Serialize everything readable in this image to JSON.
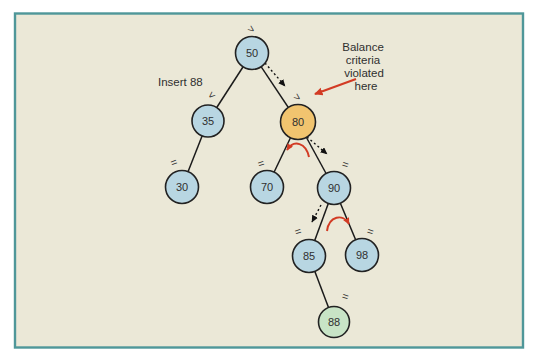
{
  "colors": {
    "page_bg": "#ffffff",
    "panel_bg": "#ebe8d7",
    "panel_border": "#4f9799",
    "node_fill": "#b8d6e2",
    "violated_node_fill": "#f1c46f",
    "new_node_fill": "#c8e4c6",
    "node_stroke": "#222222",
    "edge_color": "#1b1b1b",
    "dotted_arrow_color": "#111111",
    "text_color": "#2f2f2f",
    "red_arrow": "#d23b24"
  },
  "annotations": {
    "insert_label": "Insert 88",
    "balance_note": [
      "Balance",
      "criteria",
      "violated",
      "here"
    ]
  },
  "tree": {
    "nodes": [
      {
        "value": "50",
        "balance": ">",
        "state": "normal"
      },
      {
        "value": "35",
        "balance": "<",
        "state": "normal"
      },
      {
        "value": "80",
        "balance": ">",
        "state": "balance-violated"
      },
      {
        "value": "30",
        "balance": "=",
        "state": "normal"
      },
      {
        "value": "70",
        "balance": "=",
        "state": "normal"
      },
      {
        "value": "90",
        "balance": "=",
        "state": "normal"
      },
      {
        "value": "85",
        "balance": "=",
        "state": "normal"
      },
      {
        "value": "98",
        "balance": "=",
        "state": "normal"
      },
      {
        "value": "88",
        "balance": "=",
        "state": "newly-inserted"
      }
    ],
    "edges": [
      "50-35",
      "50-80",
      "35-30",
      "80-70",
      "80-90",
      "90-85",
      "90-98",
      "85-88"
    ],
    "search_path": [
      "50",
      "80",
      "90",
      "85"
    ]
  }
}
